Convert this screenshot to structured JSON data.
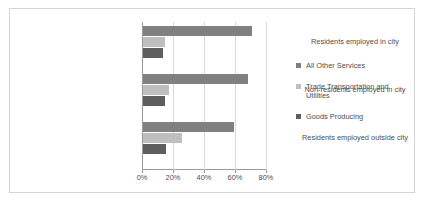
{
  "chart_data": {
    "type": "bar",
    "orientation": "horizontal",
    "title": "",
    "xlabel": "",
    "ylabel": "",
    "categories": [
      "Residents employed in city",
      "Non-residents employed in city",
      "Residents employed outside city"
    ],
    "series": [
      {
        "name": "All Other Services",
        "color": "#808080",
        "values": [
          70,
          68,
          59
        ]
      },
      {
        "name": "Trade Transportation and Utilities",
        "color": "#bfbfbf",
        "values": [
          14,
          17,
          25
        ]
      },
      {
        "name": "Goods Producing",
        "color": "#5e5e5e",
        "values": [
          13,
          14,
          15
        ]
      }
    ],
    "xlim": [
      0,
      80
    ],
    "xticks": [
      0,
      20,
      40,
      60,
      80
    ],
    "xtick_labels": [
      "0%",
      "20%",
      "40%",
      "60%",
      "80%"
    ],
    "grid": true,
    "legend_position": "right",
    "legend_entries": [
      "All Other Services",
      "Trade Transportation and Utilities",
      "Goods Producing"
    ]
  },
  "colors": {
    "frame_border": "#d4d4d4",
    "axis": "#9a9a9a",
    "gridline": "#d9d9d9",
    "text": "#4d4d4d",
    "background": "#ffffff"
  }
}
